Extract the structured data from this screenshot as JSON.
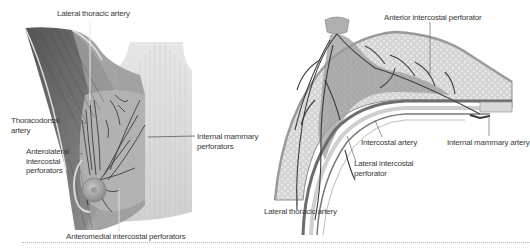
{
  "figure": {
    "colors": {
      "tissue_light": "#d9d9d9",
      "tissue_mid": "#a9a9a9",
      "tissue_dark": "#5a5a5a",
      "vessel": "#4a4a4a",
      "leader_line": "#6a6a6a",
      "label_text": "#3a3a3a"
    },
    "left_panel": {
      "view": "anterior view of chest and breast",
      "labels": [
        {
          "id": "lateral-thoracic-artery",
          "text": "Lateral thoracic artery"
        },
        {
          "id": "thoracodorsal-artery",
          "line1": "Thoracodorsal",
          "line2": "artery"
        },
        {
          "id": "anterolateral-intercostal-perforators",
          "line1": "Anterolateral",
          "line2": "intercostal",
          "line3": "perforators"
        },
        {
          "id": "internal-mammary-perforators",
          "line1": "Internal mammary",
          "line2": "perforators"
        },
        {
          "id": "anteromedial-intercostal-perforators",
          "text": "Anteromedial intercostal perforators"
        }
      ]
    },
    "right_panel": {
      "view": "cross-section of breast",
      "labels": [
        {
          "id": "anterior-intercostal-perforator",
          "text": "Anterior intercostal perforator"
        },
        {
          "id": "intercostal-artery",
          "text": "Intercostal artery"
        },
        {
          "id": "internal-mammary-artery",
          "text": "Internal mammary artery"
        },
        {
          "id": "lateral-intercostal-perforator",
          "line1": "Lateral intercostal",
          "line2": "perforator"
        },
        {
          "id": "lateral-thoracic-artery-section",
          "text": "Lateral thoracic artery"
        }
      ]
    }
  }
}
